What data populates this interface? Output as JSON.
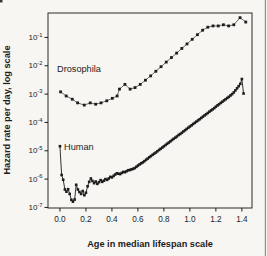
{
  "figure": {
    "background": "#f7f6f3",
    "ink": "#1c1c1c",
    "frame_color": "#2b2b2b",
    "scan_edge_color": "#909090"
  },
  "chart_data": {
    "type": "scatter",
    "title": "",
    "xlabel": "Age in median lifespan scale",
    "ylabel": "Hazard rate per day, log scale",
    "grid": false,
    "legend_position": "in-plot text annotations",
    "x_axis": {
      "min": -0.092,
      "max": 1.478,
      "ticks": [
        0.0,
        0.2,
        0.4,
        0.6,
        0.8,
        1.0,
        1.2,
        1.4
      ],
      "tick_labels": [
        "0.0",
        "0.2",
        "0.4",
        "0.6",
        "0.8",
        "1.0",
        "1.2",
        "1.4"
      ]
    },
    "y_axis": {
      "scale": "log",
      "bottom_exp": -7.02,
      "top_exp": -0.137,
      "tick_base": "10",
      "tick_exponents": [
        -1,
        -2,
        -3,
        -4,
        -5,
        -6,
        -7
      ]
    },
    "series": [
      {
        "name": "Drosophila",
        "marker": "square",
        "marker_size": 2.8,
        "line_color": "#4a4a4a",
        "line_width": 0.8,
        "points": [
          [
            0.005,
            0.0012
          ],
          [
            0.048,
            0.00086
          ],
          [
            0.095,
            0.00066
          ],
          [
            0.136,
            0.00049
          ],
          [
            0.187,
            0.00041
          ],
          [
            0.233,
            0.00049
          ],
          [
            0.275,
            0.00044
          ],
          [
            0.316,
            0.00049
          ],
          [
            0.36,
            0.00058
          ],
          [
            0.403,
            0.00071
          ],
          [
            0.44,
            0.00086
          ],
          [
            0.458,
            0.0015
          ],
          [
            0.5,
            0.0022
          ],
          [
            0.54,
            0.0015
          ],
          [
            0.578,
            0.0017
          ],
          [
            0.618,
            0.0022
          ],
          [
            0.658,
            0.0031
          ],
          [
            0.698,
            0.0044
          ],
          [
            0.738,
            0.0064
          ],
          [
            0.778,
            0.0093
          ],
          [
            0.818,
            0.0135
          ],
          [
            0.858,
            0.0195
          ],
          [
            0.898,
            0.028
          ],
          [
            0.938,
            0.041
          ],
          [
            0.978,
            0.059
          ],
          [
            1.018,
            0.086
          ],
          [
            1.058,
            0.125
          ],
          [
            1.098,
            0.18
          ],
          [
            1.138,
            0.23
          ],
          [
            1.178,
            0.255
          ],
          [
            1.218,
            0.255
          ],
          [
            1.258,
            0.28
          ],
          [
            1.298,
            0.255
          ],
          [
            1.338,
            0.28
          ],
          [
            1.386,
            0.5
          ],
          [
            1.43,
            0.35
          ]
        ]
      },
      {
        "name": "Human",
        "marker": "square",
        "marker_size": 2.6,
        "line_color": "#1c1c1c",
        "line_width": 0.9,
        "points": [
          [
            0.0,
            1.45e-05
          ],
          [
            0.013,
            1.4e-06
          ],
          [
            0.025,
            9.5e-07
          ],
          [
            0.038,
            4.3e-07
          ],
          [
            0.05,
            3.6e-07
          ],
          [
            0.063,
            4.4e-07
          ],
          [
            0.075,
            3e-07
          ],
          [
            0.088,
            1.85e-07
          ],
          [
            0.1,
            1.6e-07
          ],
          [
            0.113,
            1.9e-07
          ],
          [
            0.125,
            6.3e-07
          ],
          [
            0.138,
            4.3e-07
          ],
          [
            0.15,
            3.5e-07
          ],
          [
            0.163,
            3e-07
          ],
          [
            0.175,
            3.8e-07
          ],
          [
            0.188,
            2.7e-07
          ],
          [
            0.2,
            3.3e-07
          ],
          [
            0.213,
            5.6e-07
          ],
          [
            0.225,
            8e-07
          ],
          [
            0.238,
            1.05e-06
          ],
          [
            0.25,
            8.6e-07
          ],
          [
            0.263,
            7.2e-07
          ],
          [
            0.275,
            8.2e-07
          ],
          [
            0.288,
            6.8e-07
          ],
          [
            0.3,
            7.8e-07
          ],
          [
            0.313,
            9.2e-07
          ],
          [
            0.325,
            8e-07
          ],
          [
            0.338,
            8.8e-07
          ],
          [
            0.35,
            1e-06
          ],
          [
            0.363,
            9.4e-07
          ],
          [
            0.375,
            1.05e-06
          ],
          [
            0.388,
            1.2e-06
          ],
          [
            0.4,
            1.15e-06
          ],
          [
            0.413,
            1.3e-06
          ],
          [
            0.425,
            1.45e-06
          ],
          [
            0.438,
            1.6e-06
          ],
          [
            0.45,
            1.55e-06
          ],
          [
            0.463,
            1.5e-06
          ],
          [
            0.475,
            1.65e-06
          ],
          [
            0.488,
            1.8e-06
          ],
          [
            0.5,
            1.75e-06
          ],
          [
            0.513,
            1.9e-06
          ],
          [
            0.525,
            2.05e-06
          ],
          [
            0.538,
            2.1e-06
          ],
          [
            0.55,
            2.2e-06
          ],
          [
            0.563,
            2.3e-06
          ],
          [
            0.575,
            2.45e-06
          ],
          [
            0.588,
            2.7e-06
          ],
          [
            0.6,
            3e-06
          ],
          [
            0.613,
            3.3e-06
          ],
          [
            0.625,
            3.6e-06
          ],
          [
            0.638,
            3.9e-06
          ],
          [
            0.65,
            4.3e-06
          ],
          [
            0.663,
            4.8e-06
          ],
          [
            0.675,
            5.3e-06
          ],
          [
            0.688,
            5.9e-06
          ],
          [
            0.7,
            6.5e-06
          ],
          [
            0.713,
            7.2e-06
          ],
          [
            0.725,
            7.9e-06
          ],
          [
            0.738,
            8.7e-06
          ],
          [
            0.75,
            9.6e-06
          ],
          [
            0.763,
            1.07e-05
          ],
          [
            0.775,
            1.18e-05
          ],
          [
            0.788,
            1.3e-05
          ],
          [
            0.8,
            1.44e-05
          ],
          [
            0.813,
            1.6e-05
          ],
          [
            0.825,
            1.77e-05
          ],
          [
            0.838,
            1.95e-05
          ],
          [
            0.85,
            2.15e-05
          ],
          [
            0.863,
            2.4e-05
          ],
          [
            0.875,
            2.65e-05
          ],
          [
            0.888,
            2.9e-05
          ],
          [
            0.9,
            3.2e-05
          ],
          [
            0.913,
            3.6e-05
          ],
          [
            0.925,
            3.9e-05
          ],
          [
            0.938,
            4.3e-05
          ],
          [
            0.95,
            4.8e-05
          ],
          [
            0.963,
            5.3e-05
          ],
          [
            0.975,
            5.9e-05
          ],
          [
            0.988,
            6.5e-05
          ],
          [
            1.0,
            7.2e-05
          ],
          [
            1.013,
            7.9e-05
          ],
          [
            1.025,
            8.8e-05
          ],
          [
            1.038,
            9.7e-05
          ],
          [
            1.05,
            0.000107
          ],
          [
            1.063,
            0.000118
          ],
          [
            1.075,
            0.00013
          ],
          [
            1.088,
            0.000144
          ],
          [
            1.1,
            0.00016
          ],
          [
            1.113,
            0.000177
          ],
          [
            1.125,
            0.000195
          ],
          [
            1.138,
            0.000215
          ],
          [
            1.15,
            0.00024
          ],
          [
            1.163,
            0.000265
          ],
          [
            1.175,
            0.00029
          ],
          [
            1.188,
            0.00032
          ],
          [
            1.2,
            0.00036
          ],
          [
            1.213,
            0.0004
          ],
          [
            1.225,
            0.00044
          ],
          [
            1.238,
            0.00049
          ],
          [
            1.25,
            0.00054
          ],
          [
            1.263,
            0.0006
          ],
          [
            1.275,
            0.00066
          ],
          [
            1.288,
            0.00073
          ],
          [
            1.3,
            0.0008
          ],
          [
            1.313,
            0.0009
          ],
          [
            1.325,
            0.001
          ],
          [
            1.338,
            0.00115
          ],
          [
            1.35,
            0.00135
          ],
          [
            1.363,
            0.0016
          ],
          [
            1.375,
            0.0019
          ],
          [
            1.388,
            0.0023
          ],
          [
            1.4,
            0.0034
          ],
          [
            1.413,
            0.00105
          ]
        ]
      }
    ]
  }
}
